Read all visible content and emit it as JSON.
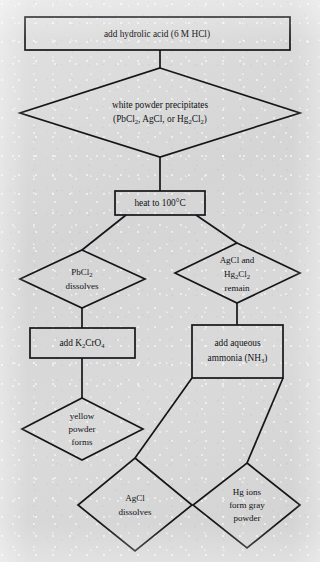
{
  "diagram": {
    "type": "flowchart",
    "orientation": "top-to-bottom",
    "background_color": "#d7d7d7",
    "stroke_color": "#16161a",
    "nodes": [
      {
        "id": "add-hcl",
        "shape": "rectangle",
        "text": "add hydrolic acid (6 M HCl)",
        "lines": [
          [
            {
              "t": "add hydrolic acid (6 M HCl)"
            }
          ]
        ]
      },
      {
        "id": "white-powder",
        "shape": "diamond",
        "text": "white powder precipitates (PbCl2, AgCl, or Hg2Cl2)",
        "lines": [
          [
            {
              "t": "white powder precipitates"
            }
          ],
          [
            {
              "t": "(PbCl"
            },
            {
              "t": "2",
              "sub": true
            },
            {
              "t": ", AgCl, or Hg"
            },
            {
              "t": "2",
              "sub": true
            },
            {
              "t": "Cl"
            },
            {
              "t": "2",
              "sub": true
            },
            {
              "t": ")"
            }
          ]
        ]
      },
      {
        "id": "heat",
        "shape": "rectangle",
        "text": "heat to 100°C",
        "lines": [
          [
            {
              "t": "heat to 100°C"
            }
          ]
        ]
      },
      {
        "id": "pbcl2-dissolves",
        "shape": "diamond",
        "text": "PbCl2 dissolves",
        "lines": [
          [
            {
              "t": "PbCl"
            },
            {
              "t": "2",
              "sub": true
            }
          ],
          [
            {
              "t": "dissolves"
            }
          ]
        ]
      },
      {
        "id": "agcl-hg2cl2-remain",
        "shape": "diamond",
        "text": "AgCl and Hg2Cl2 remain",
        "lines": [
          [
            {
              "t": "AgCl and"
            }
          ],
          [
            {
              "t": "Hg"
            },
            {
              "t": "2",
              "sub": true
            },
            {
              "t": "Cl"
            },
            {
              "t": "2",
              "sub": true
            }
          ],
          [
            {
              "t": "remain"
            }
          ]
        ]
      },
      {
        "id": "add-k2cro4",
        "shape": "rectangle",
        "text": "add K2CrO4",
        "lines": [
          [
            {
              "t": "add K"
            },
            {
              "t": "2",
              "sub": true
            },
            {
              "t": "CrO"
            },
            {
              "t": "4",
              "sub": true
            }
          ]
        ]
      },
      {
        "id": "add-ammonia",
        "shape": "rectangle",
        "text": "add aqueous ammonia (NH3)",
        "lines": [
          [
            {
              "t": "add aqueous"
            }
          ],
          [
            {
              "t": "ammonia (NH"
            },
            {
              "t": "3",
              "sub": true
            },
            {
              "t": ")"
            }
          ]
        ]
      },
      {
        "id": "yellow-powder",
        "shape": "diamond",
        "text": "yellow powder forms",
        "lines": [
          [
            {
              "t": "yellow"
            }
          ],
          [
            {
              "t": "powder"
            }
          ],
          [
            {
              "t": "forms"
            }
          ]
        ]
      },
      {
        "id": "agcl-dissolves",
        "shape": "diamond",
        "text": "AgCl dissolves",
        "lines": [
          [
            {
              "t": "AgCl"
            }
          ],
          [
            {
              "t": "dissolves"
            }
          ]
        ]
      },
      {
        "id": "hg-gray-powder",
        "shape": "diamond",
        "text": "Hg ions form gray powder",
        "lines": [
          [
            {
              "t": "Hg ions"
            }
          ],
          [
            {
              "t": "form gray"
            }
          ],
          [
            {
              "t": "powder"
            }
          ]
        ]
      }
    ],
    "edges": [
      {
        "from": "add-hcl",
        "to": "white-powder"
      },
      {
        "from": "white-powder",
        "to": "heat"
      },
      {
        "from": "heat",
        "to": "pbcl2-dissolves"
      },
      {
        "from": "heat",
        "to": "agcl-hg2cl2-remain"
      },
      {
        "from": "pbcl2-dissolves",
        "to": "add-k2cro4"
      },
      {
        "from": "agcl-hg2cl2-remain",
        "to": "add-ammonia"
      },
      {
        "from": "add-k2cro4",
        "to": "yellow-powder"
      },
      {
        "from": "add-ammonia",
        "to": "agcl-dissolves"
      },
      {
        "from": "add-ammonia",
        "to": "hg-gray-powder"
      }
    ]
  }
}
